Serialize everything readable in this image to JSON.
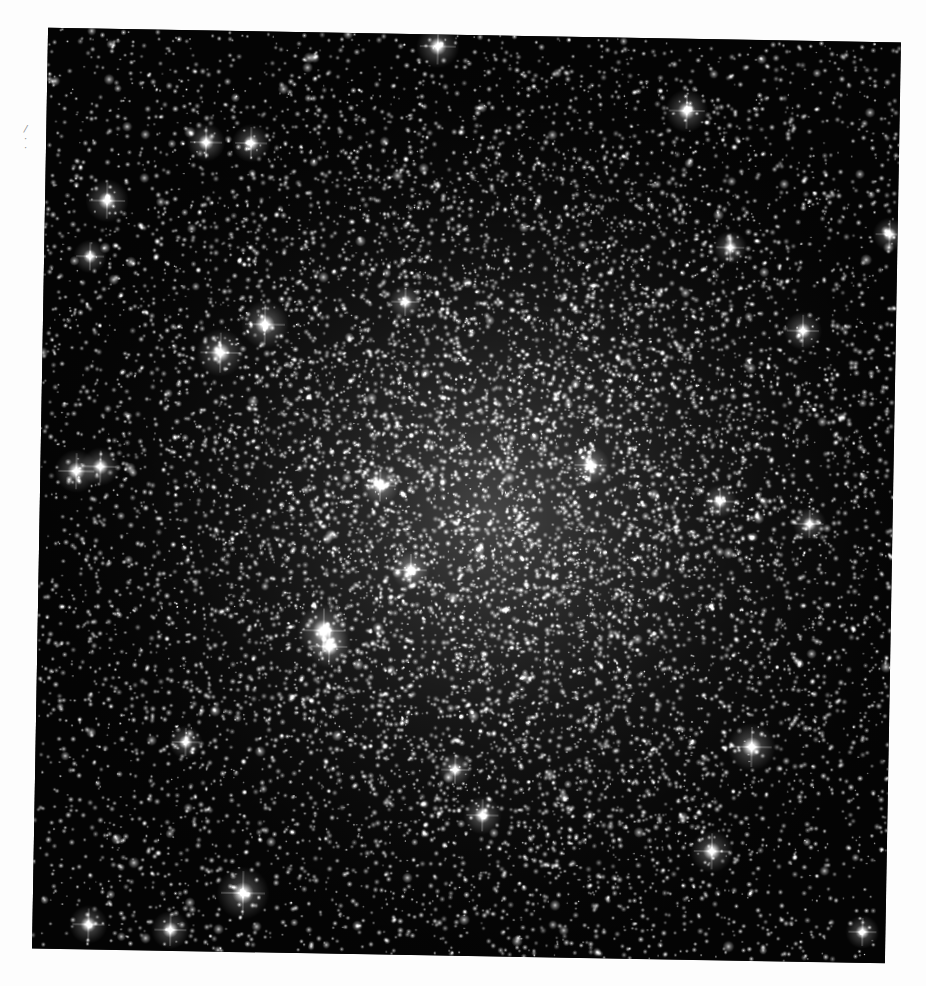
{
  "image": {
    "subject": "globular star cluster",
    "description": "Dense field of stars on black background, concentrated toward center",
    "background_color": "#040404",
    "page_color": "#fdfdfd",
    "frame": {
      "left": 40,
      "top": 35,
      "width": 853,
      "height": 921,
      "rotation_deg": 1.0
    },
    "cluster_center": {
      "x": 0.53,
      "y": 0.52
    },
    "core_radius_frac": 0.22,
    "star_counts": {
      "background": 5200,
      "cluster": 9000
    },
    "seed": 1337
  },
  "scan_marks": [
    {
      "text": "/",
      "x": 24,
      "y": 124
    },
    {
      "text": "·",
      "x": 24,
      "y": 134
    },
    {
      "text": "·",
      "x": 24,
      "y": 143
    }
  ],
  "bright_stars": [
    {
      "x": 390,
      "y": 12,
      "r": 9
    },
    {
      "x": 640,
      "y": 72,
      "r": 9
    },
    {
      "x": 160,
      "y": 112,
      "r": 8
    },
    {
      "x": 205,
      "y": 112,
      "r": 8
    },
    {
      "x": 62,
      "y": 172,
      "r": 9
    },
    {
      "x": 46,
      "y": 228,
      "r": 7
    },
    {
      "x": 686,
      "y": 208,
      "r": 7
    },
    {
      "x": 222,
      "y": 293,
      "r": 10
    },
    {
      "x": 178,
      "y": 322,
      "r": 10
    },
    {
      "x": 362,
      "y": 268,
      "r": 7
    },
    {
      "x": 760,
      "y": 290,
      "r": 8
    },
    {
      "x": 36,
      "y": 443,
      "r": 9
    },
    {
      "x": 60,
      "y": 438,
      "r": 8
    },
    {
      "x": 340,
      "y": 452,
      "r": 8
    },
    {
      "x": 550,
      "y": 428,
      "r": 8
    },
    {
      "x": 680,
      "y": 462,
      "r": 7
    },
    {
      "x": 770,
      "y": 483,
      "r": 7
    },
    {
      "x": 372,
      "y": 536,
      "r": 8
    },
    {
      "x": 286,
      "y": 598,
      "r": 11
    },
    {
      "x": 292,
      "y": 614,
      "r": 9
    },
    {
      "x": 150,
      "y": 712,
      "r": 7
    },
    {
      "x": 716,
      "y": 707,
      "r": 10
    },
    {
      "x": 420,
      "y": 735,
      "r": 7
    },
    {
      "x": 448,
      "y": 780,
      "r": 8
    },
    {
      "x": 678,
      "y": 812,
      "r": 9
    },
    {
      "x": 210,
      "y": 862,
      "r": 11
    },
    {
      "x": 138,
      "y": 900,
      "r": 8
    },
    {
      "x": 56,
      "y": 896,
      "r": 8
    },
    {
      "x": 830,
      "y": 890,
      "r": 7
    },
    {
      "x": 845,
      "y": 192,
      "r": 7
    }
  ]
}
